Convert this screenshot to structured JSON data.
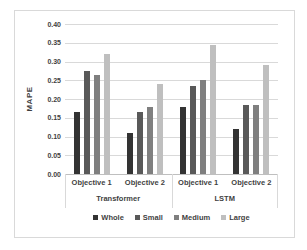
{
  "chart_data": {
    "type": "bar",
    "title": "",
    "ylabel": "MAPE",
    "xlabel": "",
    "ylim": [
      0,
      0.4
    ],
    "y_tick_step": 0.05,
    "y_tick_labels": [
      "0.40",
      "0.35",
      "0.30",
      "0.25",
      "0.20",
      "0.15",
      "0.10",
      "0.05",
      "0.00"
    ],
    "grid": true,
    "legend_position": "bottom",
    "categories": [
      "Objective 1",
      "Objective 2",
      "Objective 1",
      "Objective 2"
    ],
    "category_groups": [
      {
        "label": "Transformer",
        "span": 2
      },
      {
        "label": "LSTM",
        "span": 2
      }
    ],
    "series": [
      {
        "name": "Whole",
        "color": "#333333",
        "values": [
          0.165,
          0.11,
          0.18,
          0.12
        ]
      },
      {
        "name": "Small",
        "color": "#595959",
        "values": [
          0.275,
          0.165,
          0.235,
          0.185
        ]
      },
      {
        "name": "Medium",
        "color": "#7f7f7f",
        "values": [
          0.265,
          0.18,
          0.25,
          0.185
        ]
      },
      {
        "name": "Large",
        "color": "#bfbfbf",
        "values": [
          0.32,
          0.24,
          0.345,
          0.29
        ]
      }
    ],
    "colors": {
      "gridline": "#d9d9d9",
      "axis_line": "#bfbfbf",
      "text": "#3f3f3f",
      "frame_border": "#d9d9d9",
      "background": "#ffffff"
    }
  }
}
